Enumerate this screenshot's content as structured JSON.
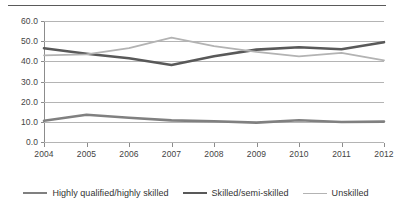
{
  "chart_data": {
    "type": "line",
    "title": "",
    "subtitle": "",
    "xlabel": "",
    "ylabel": "",
    "categories": [
      "2004",
      "2005",
      "2006",
      "2007",
      "2008",
      "2009",
      "2010",
      "2011",
      "2012"
    ],
    "x": [
      2004,
      2005,
      2006,
      2007,
      2008,
      2009,
      2010,
      2011,
      2012
    ],
    "ylim": [
      0.0,
      60.0
    ],
    "yticks": [
      0.0,
      10.0,
      20.0,
      30.0,
      40.0,
      50.0,
      60.0
    ],
    "ytick_labels": [
      "0.0",
      "10.0",
      "20.0",
      "30.0",
      "40.0",
      "50.0",
      "60.0"
    ],
    "grid": "horizontal",
    "legend_position": "bottom",
    "series": [
      {
        "name": "Highly qualified/highly skilled",
        "color": "#808080",
        "width": 2.6,
        "values": [
          10.5,
          13.5,
          12.0,
          10.7,
          10.3,
          9.6,
          10.8,
          9.9,
          10.1
        ]
      },
      {
        "name": "Skilled/semi-skilled",
        "color": "#595959",
        "width": 2.6,
        "values": [
          46.5,
          43.8,
          41.5,
          38.2,
          42.5,
          45.8,
          47.0,
          46.0,
          49.5
        ]
      },
      {
        "name": "Unskilled",
        "color": "#b3b3b3",
        "width": 1.8,
        "values": [
          43.0,
          43.5,
          46.5,
          51.7,
          47.5,
          44.7,
          42.5,
          44.2,
          40.5
        ]
      }
    ]
  },
  "legend": {
    "items": [
      {
        "label": "Highly qualified/highly skilled",
        "color": "#808080",
        "width": 2.6
      },
      {
        "label": "Skilled/semi-skilled",
        "color": "#595959",
        "width": 2.6
      },
      {
        "label": "Unskilled",
        "color": "#b3b3b3",
        "width": 1.8
      }
    ]
  },
  "axis_colors": {
    "grid": "#b4b4b4",
    "axis": "#8c8c8c",
    "tick_text": "#444444",
    "top_rule": "#5a5a5a"
  }
}
